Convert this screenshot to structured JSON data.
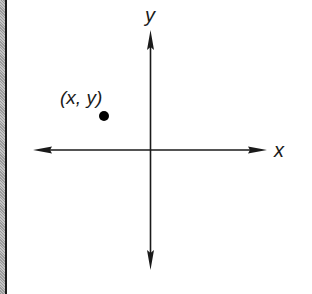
{
  "diagram": {
    "type": "coordinate-plane",
    "axes": {
      "x_label": "x",
      "y_label": "y",
      "origin": [
        150,
        150
      ],
      "x_range_px": [
        33,
        267
      ],
      "y_range_px": [
        30,
        270
      ],
      "arrows": "both-ends",
      "color": "#1a1a1a"
    },
    "point": {
      "label": "(x, y)",
      "cx": 104,
      "cy": 116,
      "r": 5,
      "quadrant": "II",
      "color": "#000000"
    }
  }
}
